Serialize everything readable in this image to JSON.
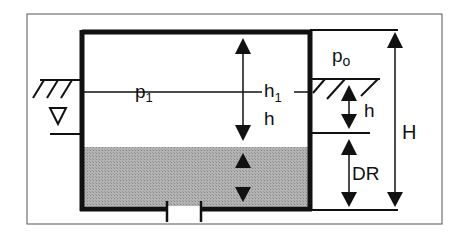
{
  "diagram": {
    "colors": {
      "line": "#111111",
      "frame": "#555555",
      "fluid": "#a9a9a9",
      "background": "#ffffff"
    },
    "labels": {
      "p1": "p",
      "p1_sub": "1",
      "h1": "h",
      "h1_sub": "1",
      "h_inner": "h",
      "po": "p",
      "po_sub": "o",
      "h_right": "h",
      "H": "H",
      "DR": "DR"
    },
    "symbols": {
      "water_level": "nabla-icon",
      "ground_left": "ground-hatch-icon",
      "ground_right": "ground-hatch-icon",
      "outlet": "outlet-pipe"
    }
  }
}
